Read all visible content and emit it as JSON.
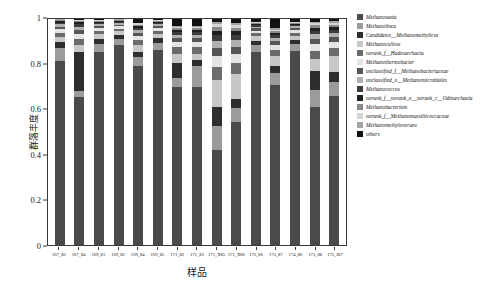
{
  "chart_data": {
    "type": "bar",
    "subtype": "stacked-bar-relative-abundance",
    "title": "",
    "xlabel": "样品",
    "ylabel": "群落丰度",
    "ylim": [
      0,
      1
    ],
    "ytick_labels": [
      "0",
      "0.2",
      "0.4",
      "0.6",
      "0.8",
      "1"
    ],
    "ytick_values": [
      0,
      0.2,
      0.4,
      0.6,
      0.8,
      1
    ],
    "grid": false,
    "legend_position": "right",
    "categories": [
      "167_82",
      "167_84",
      "169_81",
      "169_82",
      "169_84",
      "169_85",
      "171_82",
      "171_83",
      "171_X85",
      "171_X86",
      "173_86",
      "173_87",
      "174_86",
      "175_88",
      "175_J87"
    ],
    "series": [
      {
        "name": "Methanosaeta",
        "color": "#4a4a4a",
        "values": [
          0.815,
          0.655,
          0.855,
          0.885,
          0.79,
          0.87,
          0.7,
          0.7,
          0.42,
          0.545,
          0.855,
          0.71,
          0.86,
          0.61,
          0.66
        ]
      },
      {
        "name": "Methanolinea",
        "color": "#9b9b9b",
        "values": [
          0.055,
          0.03,
          0.035,
          0.028,
          0.04,
          0.032,
          0.04,
          0.09,
          0.105,
          0.06,
          0.03,
          0.05,
          0.028,
          0.075,
          0.06
        ]
      },
      {
        "name": "Candidatus__Methanomethylicus",
        "color": "#2e2e2e",
        "values": [
          0.03,
          0.17,
          0.022,
          0.018,
          0.025,
          0.02,
          0.065,
          0.03,
          0.085,
          0.04,
          0.02,
          0.03,
          0.02,
          0.085,
          0.045
        ]
      },
      {
        "name": "Methanoculleus",
        "color": "#c7c7c7",
        "values": [
          0.022,
          0.035,
          0.02,
          0.015,
          0.03,
          0.018,
          0.04,
          0.025,
          0.12,
          0.11,
          0.018,
          0.045,
          0.016,
          0.055,
          0.07
        ]
      },
      {
        "name": "norank_f__Hadesarchaeia",
        "color": "#6b6b6b",
        "values": [
          0.018,
          0.025,
          0.015,
          0.012,
          0.022,
          0.014,
          0.03,
          0.03,
          0.06,
          0.05,
          0.014,
          0.028,
          0.014,
          0.035,
          0.035
        ]
      },
      {
        "name": "Methanothermobacter",
        "color": "#e4e4e4",
        "values": [
          0.014,
          0.02,
          0.012,
          0.01,
          0.018,
          0.012,
          0.022,
          0.022,
          0.045,
          0.04,
          0.012,
          0.022,
          0.012,
          0.028,
          0.028
        ]
      },
      {
        "name": "unclassified_f__Methanobacteriaceae",
        "color": "#565656",
        "values": [
          0.012,
          0.018,
          0.01,
          0.008,
          0.015,
          0.01,
          0.018,
          0.018,
          0.038,
          0.033,
          0.01,
          0.018,
          0.01,
          0.024,
          0.022
        ]
      },
      {
        "name": "unclassified_o__Methanomicrobiales",
        "color": "#b0b0b0",
        "values": [
          0.01,
          0.015,
          0.008,
          0.007,
          0.012,
          0.008,
          0.015,
          0.015,
          0.03,
          0.028,
          0.008,
          0.015,
          0.008,
          0.02,
          0.018
        ]
      },
      {
        "name": "Methanococcus",
        "color": "#3c3c3c",
        "values": [
          0.008,
          0.012,
          0.007,
          0.006,
          0.01,
          0.007,
          0.012,
          0.012,
          0.025,
          0.022,
          0.007,
          0.012,
          0.007,
          0.016,
          0.015
        ]
      },
      {
        "name": "norank_f__norank_o__norank_c__Odinarchaeia",
        "color": "#1f1f1f",
        "values": [
          0.006,
          0.008,
          0.005,
          0.004,
          0.008,
          0.005,
          0.01,
          0.01,
          0.02,
          0.018,
          0.005,
          0.01,
          0.005,
          0.013,
          0.012
        ]
      },
      {
        "name": "Methanobacterium",
        "color": "#8a8a8a",
        "values": [
          0.004,
          0.006,
          0.004,
          0.003,
          0.006,
          0.004,
          0.008,
          0.008,
          0.016,
          0.015,
          0.004,
          0.008,
          0.004,
          0.011,
          0.01
        ]
      },
      {
        "name": "norank_f__Methanomassiliicoccaceae",
        "color": "#d5d5d5",
        "values": [
          0.003,
          0.004,
          0.003,
          0.002,
          0.005,
          0.003,
          0.006,
          0.006,
          0.013,
          0.012,
          0.003,
          0.006,
          0.003,
          0.009,
          0.008
        ]
      },
      {
        "name": "Methanomethylovorans",
        "color": "#a3a3a3",
        "values": [
          0.002,
          0.003,
          0.002,
          0.001,
          0.004,
          0.002,
          0.005,
          0.005,
          0.011,
          0.01,
          0.002,
          0.005,
          0.002,
          0.007,
          0.007
        ]
      },
      {
        "name": "others",
        "color": "#111111",
        "values": [
          0.001,
          0.002,
          0.002,
          0.001,
          0.015,
          0.002,
          0.029,
          0.029,
          0.012,
          0.017,
          0.012,
          0.041,
          0.011,
          0.012,
          0.01
        ]
      }
    ]
  }
}
